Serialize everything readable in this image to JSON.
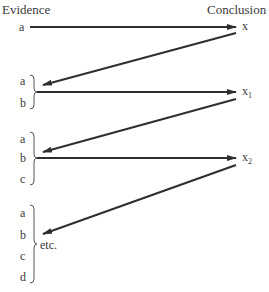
{
  "headers": {
    "left": "Evidence",
    "right": "Conclusion"
  },
  "colors": {
    "line": "#2e2e2e",
    "text": "#3a3a3a",
    "background": "#ffffff"
  },
  "groups": [
    {
      "evidence": [
        "a"
      ],
      "conclusion": {
        "base": "x",
        "sub": ""
      }
    },
    {
      "evidence": [
        "a",
        "b"
      ],
      "conclusion": {
        "base": "x",
        "sub": "1"
      }
    },
    {
      "evidence": [
        "a",
        "b",
        "c"
      ],
      "conclusion": {
        "base": "x",
        "sub": "2"
      }
    },
    {
      "evidence": [
        "a",
        "b",
        "c",
        "d"
      ],
      "trailing": "etc."
    }
  ]
}
